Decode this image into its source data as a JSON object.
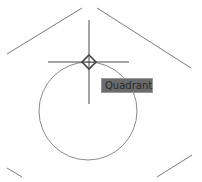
{
  "snap_tooltip": {
    "label": "Quadrant"
  },
  "colors": {
    "background": "#ffffff",
    "geometry_stroke": "#7a7a7a",
    "crosshair_stroke": "#4a4a4a",
    "snap_marker_stroke": "#444444",
    "tooltip_bg": "#6b6b6b",
    "tooltip_text": "#2a2a2a"
  },
  "geometry": {
    "circle": {
      "cx": 88,
      "cy": 111,
      "r": 49
    },
    "lines": [
      {
        "name": "hexagon-edge-top-left",
        "x1": 7,
        "y1": 54,
        "x2": 82,
        "y2": 8
      },
      {
        "name": "hexagon-edge-top-right",
        "x1": 97,
        "y1": 8,
        "x2": 191,
        "y2": 68
      },
      {
        "name": "hexagon-edge-bottom-left",
        "x1": 7,
        "y1": 168,
        "x2": 22,
        "y2": 177
      },
      {
        "name": "hexagon-edge-bottom-right",
        "x1": 157,
        "y1": 177,
        "x2": 192,
        "y2": 155
      }
    ]
  },
  "cursor": {
    "x": 89,
    "y": 62,
    "h_extent": [
      48,
      129
    ],
    "v_extent": [
      20,
      104
    ],
    "snap_marker": "quadrant-diamond"
  }
}
